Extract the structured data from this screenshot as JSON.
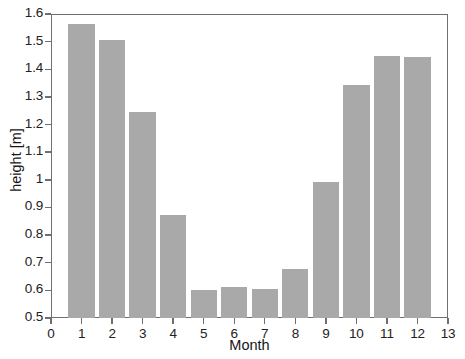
{
  "chart_data": {
    "type": "bar",
    "title": "",
    "subtitle": "",
    "xlabel": "Month",
    "ylabel": "height [m]",
    "categories": [
      "1",
      "2",
      "3",
      "4",
      "5",
      "6",
      "7",
      "8",
      "9",
      "10",
      "11",
      "12"
    ],
    "values": [
      1.565,
      1.505,
      1.245,
      0.872,
      0.603,
      0.612,
      0.605,
      0.678,
      0.992,
      1.343,
      1.447,
      1.446
    ],
    "series": [
      {
        "name": "height",
        "values": [
          1.565,
          1.505,
          1.245,
          0.872,
          0.603,
          0.612,
          0.605,
          0.678,
          0.992,
          1.343,
          1.447,
          1.446
        ]
      }
    ],
    "xlim": [
      0,
      13
    ],
    "ylim": [
      0.5,
      1.6
    ],
    "xticks": [
      "0",
      "1",
      "2",
      "3",
      "4",
      "5",
      "6",
      "7",
      "8",
      "9",
      "10",
      "11",
      "12",
      "13"
    ],
    "xtick_values": [
      0,
      1,
      2,
      3,
      4,
      5,
      6,
      7,
      8,
      9,
      10,
      11,
      12,
      13
    ],
    "yticks": [
      "0.5",
      "0.6",
      "0.7",
      "0.8",
      "0.9",
      "1",
      "1.1",
      "1.2",
      "1.3",
      "1.4",
      "1.5",
      "1.6"
    ],
    "ytick_values": [
      0.5,
      0.6,
      0.7,
      0.8,
      0.9,
      1.0,
      1.1,
      1.2,
      1.3,
      1.4,
      1.5,
      1.6
    ],
    "grid": false,
    "legend": null,
    "legend_position": "none",
    "bar_color": "#a9a9a9",
    "axis_color": "#6f6f6f",
    "text_color": "#222222",
    "background_color": "#ffffff",
    "bar_width_units": 0.86,
    "annotations": []
  }
}
